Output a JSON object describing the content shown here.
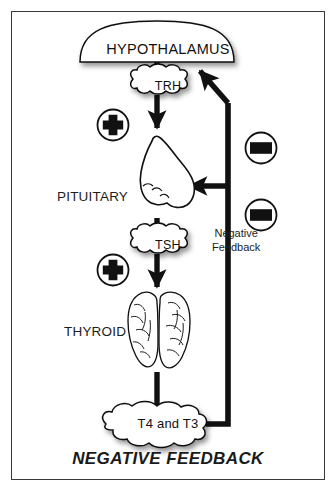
{
  "figure": {
    "title": "NEGATIVE FEEDBACK",
    "frame_color": "#3a3a3a",
    "background": "#ffffff",
    "ink_color": "#111111"
  },
  "nodes": {
    "hypothalamus": {
      "label": "HYPOTHALAMUS",
      "shape": "dome"
    },
    "trh": {
      "label": "TRH",
      "shape": "cloud"
    },
    "pituitary": {
      "label": "PITUITARY",
      "shape": "gland-bulb"
    },
    "tsh": {
      "label": "TSH",
      "shape": "cloud"
    },
    "thyroid": {
      "label": "THYROID",
      "shape": "butterfly-lobes"
    },
    "hormones": {
      "label": "T4 and T3",
      "shape": "cloud"
    }
  },
  "signs": {
    "plus_upper": {
      "symbol": "+",
      "meaning": "stimulatory"
    },
    "plus_lower": {
      "symbol": "+",
      "meaning": "stimulatory"
    },
    "minus_upper": {
      "symbol": "–",
      "meaning": "inhibitory"
    },
    "minus_lower": {
      "symbol": "–",
      "meaning": "inhibitory"
    }
  },
  "annotations": {
    "negative_feedback_line1": "Negative",
    "negative_feedback_line2": "Feedback"
  }
}
